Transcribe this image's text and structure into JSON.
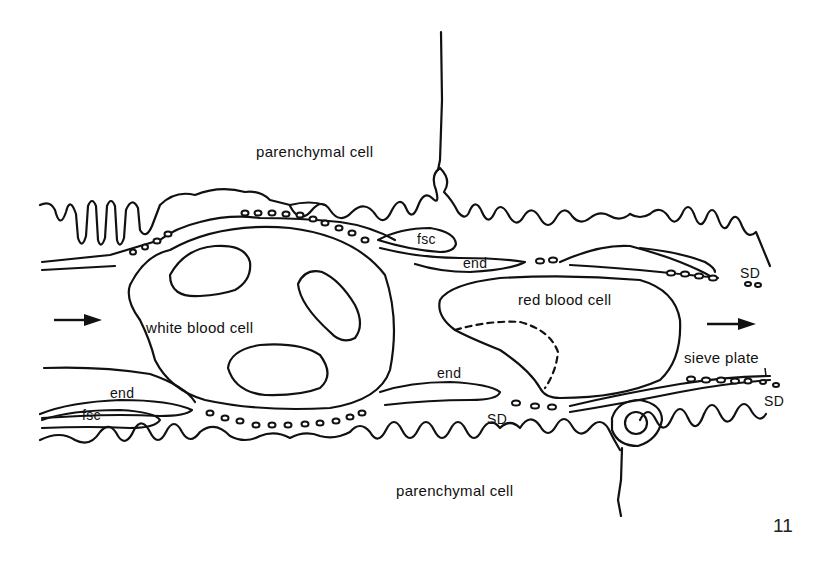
{
  "figure": {
    "number": "11",
    "flow_direction": "left-to-right",
    "colors": {
      "line": "#111111",
      "background": "#ffffff"
    }
  },
  "labels": {
    "parenchymal_top": "parenchymal cell",
    "parenchymal_bottom": "parenchymal cell",
    "white_blood_cell": "white blood cell",
    "red_blood_cell": "red blood cell",
    "sieve_plate": "sieve plate",
    "fsc_top": "fsc",
    "fsc_bottom": "fsc",
    "end_top": "end",
    "end_left": "end",
    "end_middle": "end",
    "sd_top_right": "SD",
    "sd_bottom_middle": "SD",
    "sd_bottom_right": "SD"
  },
  "icons": {
    "flow_arrow_left": "arrow-right",
    "flow_arrow_right": "arrow-right"
  }
}
